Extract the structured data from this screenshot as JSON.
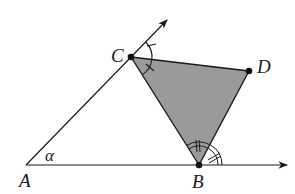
{
  "diagram": {
    "type": "geometry",
    "points": {
      "A": {
        "label": "A",
        "x": 26,
        "y": 165
      },
      "B": {
        "label": "B",
        "x": 199,
        "y": 165
      },
      "C": {
        "label": "C",
        "x": 131,
        "y": 57
      },
      "D": {
        "label": "D",
        "x": 249,
        "y": 71
      }
    },
    "angle_label": "α",
    "rays": [
      {
        "from": "A",
        "through": "C",
        "arrow_end": {
          "x": 167,
          "y": 20
        }
      },
      {
        "from": "A",
        "through": "B",
        "arrow_end": {
          "x": 287,
          "y": 165
        }
      }
    ],
    "filled_triangle": [
      "C",
      "B",
      "D"
    ],
    "fill_color": "#9a9a9a",
    "stroke_color": "#1a1a1a",
    "angle_marks": {
      "C": "single arc with single tick (equal angles: extension of AC–CD and CD–CB)",
      "B": "double arc with double tick (equal angles: BC–BD and BD–extension of AB)"
    }
  }
}
